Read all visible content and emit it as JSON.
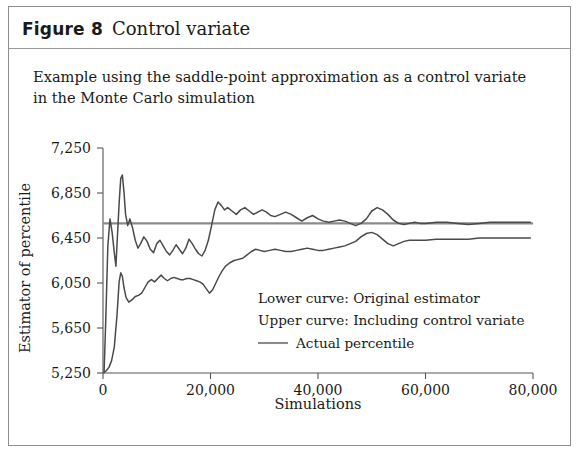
{
  "figure": {
    "label": "Figure 8",
    "title": "Control variate",
    "subtitle": "Example using the saddle-point approximation as a control variate in the Monte Carlo simulation"
  },
  "colors": {
    "curve": "#4a4a4a",
    "reference_line": "#8a8a8a",
    "axis": "#555555",
    "frame": "#8d8d8d",
    "text": "#1a1a1a",
    "background": "#ffffff"
  },
  "chart_data": {
    "type": "line",
    "title": "Control variate",
    "subtitle": "Example using the saddle-point approximation as a control variate in the Monte Carlo simulation",
    "xlabel": "Simulations",
    "ylabel": "Estimator of percentile",
    "xlim": [
      0,
      80000
    ],
    "ylim": [
      5250,
      7250
    ],
    "xticks": [
      0,
      20000,
      40000,
      60000,
      80000
    ],
    "xticklabels": [
      "0",
      "20,000",
      "40,000",
      "60,000",
      "80,000"
    ],
    "yticks": [
      5250,
      5650,
      6050,
      6450,
      6850,
      7250
    ],
    "yticklabels": [
      "5,250",
      "5,650",
      "6,050",
      "6,450",
      "6,850",
      "7,250"
    ],
    "grid": false,
    "legend_position": "center-right-inside",
    "annotations": [
      "Lower curve: Original estimator",
      "Upper curve: Including control variate"
    ],
    "reference_line": {
      "label": "Actual percentile",
      "value": 6580,
      "orientation": "horizontal"
    },
    "series": [
      {
        "name": "Including control variate",
        "note": "upper curve",
        "x": [
          200,
          500,
          900,
          1300,
          1700,
          2100,
          2400,
          2700,
          3000,
          3300,
          3600,
          3900,
          4200,
          4600,
          5000,
          5500,
          6000,
          6500,
          7000,
          7600,
          8200,
          8800,
          9400,
          10000,
          10600,
          11200,
          11800,
          12400,
          13000,
          13600,
          14200,
          14800,
          15400,
          16000,
          16600,
          17200,
          17800,
          18400,
          19000,
          19600,
          20200,
          20800,
          21400,
          22000,
          22600,
          23200,
          24000,
          24800,
          25600,
          26400,
          27200,
          28000,
          28800,
          29600,
          30400,
          31200,
          32000,
          33000,
          34000,
          35000,
          36000,
          37000,
          38000,
          39000,
          40000,
          41000,
          42000,
          43000,
          44000,
          45000,
          46000,
          47000,
          48000,
          49000,
          50000,
          51000,
          52000,
          53000,
          54000,
          55000,
          56000,
          57000,
          58000,
          59000,
          60000,
          62000,
          64000,
          66000,
          68000,
          70000,
          72000,
          74000,
          76000,
          78000,
          79500
        ],
        "y": [
          5260,
          5700,
          6380,
          6620,
          6500,
          6320,
          6200,
          6480,
          6760,
          6980,
          7010,
          6860,
          6660,
          6560,
          6620,
          6540,
          6430,
          6360,
          6400,
          6460,
          6420,
          6350,
          6320,
          6400,
          6430,
          6380,
          6330,
          6300,
          6340,
          6390,
          6350,
          6310,
          6360,
          6440,
          6400,
          6350,
          6310,
          6290,
          6340,
          6430,
          6560,
          6700,
          6770,
          6740,
          6700,
          6720,
          6690,
          6660,
          6700,
          6720,
          6690,
          6660,
          6680,
          6700,
          6680,
          6650,
          6640,
          6660,
          6680,
          6660,
          6630,
          6600,
          6630,
          6650,
          6620,
          6600,
          6590,
          6600,
          6610,
          6600,
          6580,
          6560,
          6580,
          6620,
          6690,
          6720,
          6700,
          6660,
          6610,
          6580,
          6570,
          6580,
          6590,
          6580,
          6580,
          6590,
          6590,
          6580,
          6570,
          6580,
          6590,
          6590,
          6590,
          6590,
          6590
        ]
      },
      {
        "name": "Original estimator",
        "note": "lower curve",
        "x": [
          200,
          600,
          1100,
          1600,
          2100,
          2600,
          3000,
          3300,
          3600,
          3900,
          4300,
          4800,
          5400,
          6000,
          6600,
          7200,
          7800,
          8400,
          9000,
          9600,
          10200,
          10800,
          11400,
          12000,
          12600,
          13200,
          13800,
          14400,
          15000,
          15600,
          16200,
          16800,
          17400,
          18000,
          18600,
          19200,
          19800,
          20400,
          21000,
          21600,
          22200,
          22800,
          23600,
          24400,
          25200,
          26000,
          26800,
          27600,
          28400,
          29200,
          30000,
          31000,
          32000,
          33000,
          34000,
          35000,
          36000,
          37000,
          38000,
          39000,
          40000,
          41000,
          42000,
          43000,
          44000,
          45000,
          46000,
          47000,
          48000,
          49000,
          50000,
          51000,
          52000,
          53000,
          54000,
          55000,
          56000,
          57000,
          58000,
          59000,
          60000,
          62000,
          64000,
          66000,
          68000,
          70000,
          72000,
          74000,
          76000,
          78000,
          79500
        ],
        "y": [
          5255,
          5270,
          5300,
          5360,
          5480,
          5760,
          6060,
          6140,
          6110,
          6010,
          5920,
          5880,
          5900,
          5930,
          5940,
          5960,
          6010,
          6060,
          6080,
          6060,
          6090,
          6120,
          6090,
          6070,
          6090,
          6100,
          6090,
          6080,
          6080,
          6090,
          6090,
          6080,
          6070,
          6060,
          6040,
          6000,
          5960,
          5990,
          6050,
          6110,
          6160,
          6200,
          6230,
          6250,
          6260,
          6270,
          6300,
          6330,
          6350,
          6340,
          6330,
          6340,
          6350,
          6340,
          6330,
          6330,
          6340,
          6350,
          6360,
          6350,
          6340,
          6340,
          6350,
          6360,
          6370,
          6380,
          6400,
          6420,
          6460,
          6490,
          6500,
          6480,
          6440,
          6400,
          6380,
          6400,
          6420,
          6430,
          6430,
          6430,
          6430,
          6440,
          6440,
          6440,
          6440,
          6450,
          6450,
          6450,
          6450,
          6450,
          6450
        ]
      }
    ]
  }
}
